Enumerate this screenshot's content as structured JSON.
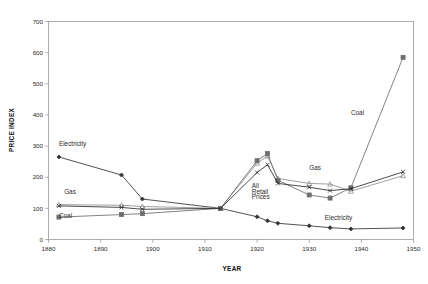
{
  "chart_data": {
    "type": "line",
    "title": "",
    "xlabel": "YEAR",
    "ylabel": "PRICE INDEX",
    "xlim": [
      1880,
      1950
    ],
    "ylim": [
      0,
      700
    ],
    "xticks": [
      1880,
      1890,
      1900,
      1910,
      1920,
      1930,
      1940,
      1950
    ],
    "xticklabels": [
      "1880",
      "1890",
      "1900",
      "1910",
      "1920",
      "1930",
      "1940",
      "1950"
    ],
    "yticks": [
      0,
      100,
      200,
      300,
      400,
      500,
      600,
      700
    ],
    "yticklabels": [
      "0",
      "100",
      "200",
      "300",
      "400",
      "500",
      "600",
      "700"
    ],
    "grid": false,
    "legend": "inline-annotations",
    "series": [
      {
        "name": "Electricity",
        "marker": "diamond",
        "color": "#333333",
        "x": [
          1882,
          1894,
          1898,
          1913,
          1920,
          1922,
          1924,
          1930,
          1934,
          1938,
          1948
        ],
        "y": [
          265,
          207,
          130,
          100,
          73,
          60,
          52,
          44,
          38,
          34,
          37
        ]
      },
      {
        "name": "Gas",
        "marker": "triangle",
        "color": "#8f8f8f",
        "x": [
          1882,
          1894,
          1898,
          1913,
          1920,
          1922,
          1924,
          1930,
          1934,
          1938,
          1948
        ],
        "y": [
          112,
          110,
          106,
          100,
          245,
          268,
          196,
          180,
          178,
          155,
          205
        ]
      },
      {
        "name": "Coal",
        "marker": "square",
        "color": "#6d6d6d",
        "x": [
          1882,
          1894,
          1898,
          1913,
          1920,
          1922,
          1924,
          1930,
          1934,
          1938,
          1948
        ],
        "y": [
          72,
          80,
          83,
          100,
          253,
          276,
          190,
          143,
          133,
          166,
          585
        ]
      },
      {
        "name": "All Retail Prices",
        "marker": "cross",
        "color": "#2b2b2b",
        "x": [
          1882,
          1894,
          1898,
          1913,
          1920,
          1922,
          1924,
          1930,
          1934,
          1938,
          1948
        ],
        "y": [
          108,
          103,
          97,
          100,
          215,
          240,
          180,
          168,
          157,
          163,
          217
        ]
      }
    ],
    "annotations": [
      {
        "text": "Electricity",
        "x": 1882,
        "y": 300,
        "name": "electricity-left"
      },
      {
        "text": "Gas",
        "x": 1883,
        "y": 145,
        "name": "gas-left"
      },
      {
        "text": "Coal",
        "x": 1882,
        "y": 70,
        "name": "coal-left"
      },
      {
        "text": "All",
        "x": 1919,
        "y": 165,
        "name": "all-retail-1"
      },
      {
        "text": "Retail",
        "x": 1919,
        "y": 147,
        "name": "all-retail-2"
      },
      {
        "text": "Prices",
        "x": 1919,
        "y": 129,
        "name": "all-retail-3"
      },
      {
        "text": "Gas",
        "x": 1930,
        "y": 222,
        "name": "gas-right"
      },
      {
        "text": "Coal",
        "x": 1938,
        "y": 400,
        "name": "coal-right"
      },
      {
        "text": "Electricity",
        "x": 1933,
        "y": 63,
        "name": "electricity-right"
      }
    ]
  }
}
